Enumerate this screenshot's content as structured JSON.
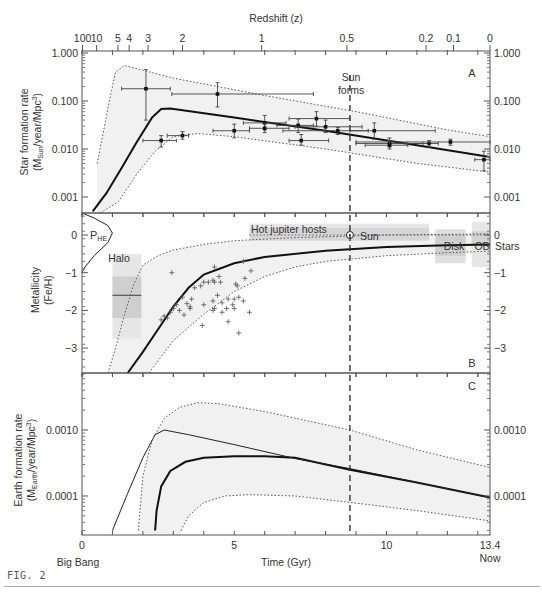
{
  "figure_label": "FIG. 2",
  "top_axis": {
    "title": "Redshift (z)",
    "ticks": [
      {
        "label": "100",
        "t": 0.02
      },
      {
        "label": "10",
        "t": 0.48
      },
      {
        "label": "5",
        "t": 1.18
      },
      {
        "label": "4",
        "t": 1.55
      },
      {
        "label": "3",
        "t": 2.17
      },
      {
        "label": "2",
        "t": 3.3
      },
      {
        "label": "1",
        "t": 5.9
      },
      {
        "label": "0.5",
        "t": 8.7
      },
      {
        "label": "0.2",
        "t": 11.3
      },
      {
        "label": "0.1",
        "t": 12.2
      },
      {
        "label": "0",
        "t": 13.4
      }
    ]
  },
  "bottom_axis": {
    "title": "Time (Gyr)",
    "ticks": [
      {
        "label": "0",
        "t": 0
      },
      {
        "label": "5",
        "t": 5
      },
      {
        "label": "10",
        "t": 10
      },
      {
        "label": "13.4",
        "t": 13.4
      }
    ],
    "start_label": "Big Bang",
    "end_label": "Now"
  },
  "sun_line": {
    "t": 8.8,
    "label_line1": "Sun",
    "label_line2": "forms"
  },
  "chart_data": [
    {
      "panel": "A",
      "type": "line",
      "title": "",
      "ylabel_line1": "Star formation rate",
      "ylabel_line2": "(M_Sun/year/Mpc^3)",
      "ylabel_main": "(M",
      "ylabel_sub": "Sun",
      "ylabel_rest": "/year/Mpc",
      "ylabel_sup": "3",
      "ylabel_close": ")",
      "xlabel": "Time (Gyr)",
      "yscale": "log",
      "ylim": [
        0.0005,
        1.0
      ],
      "yticks": [
        "1.000",
        "0.100",
        "0.010",
        "0.001"
      ],
      "ytick_values": [
        1.0,
        0.1,
        0.01,
        0.001
      ],
      "series": [
        {
          "name": "best-fit",
          "style": "solid-thick",
          "x": [
            0.35,
            0.8,
            1.3,
            1.8,
            2.3,
            2.6,
            2.9,
            5,
            8,
            11,
            13.4
          ],
          "y": [
            0.0005,
            0.0012,
            0.004,
            0.014,
            0.045,
            0.068,
            0.07,
            0.045,
            0.024,
            0.012,
            0.0068
          ]
        },
        {
          "name": "upper bound",
          "style": "dotted",
          "x": [
            0.5,
            0.9,
            1.1,
            1.4,
            3,
            6,
            9,
            12,
            13.4
          ],
          "y": [
            0.005,
            0.1,
            0.4,
            0.55,
            0.3,
            0.13,
            0.06,
            0.025,
            0.018
          ]
        },
        {
          "name": "lower bound",
          "style": "dotted",
          "x": [
            0.6,
            1.2,
            1.8,
            2.4,
            3.0,
            3.8,
            5,
            8,
            11,
            13.4
          ],
          "y": [
            0.0003,
            0.0008,
            0.003,
            0.009,
            0.018,
            0.021,
            0.018,
            0.01,
            0.005,
            0.0033
          ]
        }
      ],
      "points": [
        {
          "x": 2.1,
          "y": 0.18,
          "xerr": [
            1.3,
            2.9
          ],
          "yerr": [
            0.04,
            0.45
          ]
        },
        {
          "x": 4.45,
          "y": 0.14,
          "xerr": [
            2.95,
            7.6
          ],
          "yerr": [
            0.075,
            0.24
          ]
        },
        {
          "x": 2.6,
          "y": 0.015,
          "xerr": [
            2.0,
            3.1
          ],
          "yerr": [
            0.011,
            0.019
          ]
        },
        {
          "x": 3.3,
          "y": 0.019,
          "xerr": [
            2.8,
            3.5
          ],
          "yerr": [
            0.016,
            0.023
          ]
        },
        {
          "x": 5.0,
          "y": 0.024,
          "xerr": [
            4.3,
            5.5
          ],
          "yerr": [
            0.017,
            0.033
          ]
        },
        {
          "x": 6.0,
          "y": 0.035,
          "xerr": [
            5.3,
            6.7
          ],
          "yerr": [
            0.025,
            0.05
          ]
        },
        {
          "x": 6.0,
          "y": 0.027,
          "xerr": [
            5.5,
            6.8
          ],
          "yerr": [
            0.022,
            0.034
          ]
        },
        {
          "x": 7.1,
          "y": 0.031,
          "xerr": [
            6.4,
            7.6
          ],
          "yerr": [
            0.022,
            0.042
          ]
        },
        {
          "x": 7.7,
          "y": 0.043,
          "xerr": [
            6.8,
            8.8
          ],
          "yerr": [
            0.03,
            0.06
          ]
        },
        {
          "x": 8.0,
          "y": 0.029,
          "xerr": [
            7.0,
            9.2
          ],
          "yerr": [
            0.022,
            0.04
          ]
        },
        {
          "x": 7.2,
          "y": 0.015,
          "xerr": [
            6.8,
            8.1
          ],
          "yerr": [
            0.012,
            0.02
          ]
        },
        {
          "x": 8.4,
          "y": 0.024,
          "xerr": [
            6.6,
            9.4
          ],
          "yerr": [
            0.02,
            0.028
          ]
        },
        {
          "x": 9.6,
          "y": 0.024,
          "xerr": [
            8.8,
            11.6
          ],
          "yerr": [
            0.016,
            0.035
          ]
        },
        {
          "x": 10.1,
          "y": 0.013,
          "xerr": [
            9.0,
            11.2
          ],
          "yerr": [
            0.011,
            0.017
          ]
        },
        {
          "x": 10.1,
          "y": 0.012,
          "xerr": [
            9.3,
            10.7
          ],
          "yerr": [
            0.01,
            0.015
          ]
        },
        {
          "x": 11.4,
          "y": 0.013,
          "xerr": [
            10.7,
            11.7
          ],
          "yerr": [
            0.011,
            0.015
          ]
        },
        {
          "x": 12.1,
          "y": 0.014,
          "xerr": [
            9.0,
            13.4
          ],
          "yerr": [
            0.012,
            0.016
          ]
        },
        {
          "x": 13.2,
          "y": 0.006,
          "xerr": [
            12.9,
            13.4
          ],
          "yerr": [
            0.0035,
            0.009
          ]
        }
      ],
      "panel_label": "A"
    },
    {
      "panel": "B",
      "type": "line",
      "ylabel_line1": "Metallicity",
      "ylabel_line2": "(Fe/H)",
      "yscale": "linear",
      "ylim": [
        -3.7,
        0.6
      ],
      "yticks": [
        "0",
        "−1",
        "−2",
        "−3"
      ],
      "ytick_values": [
        0,
        -1,
        -2,
        -3
      ],
      "series": [
        {
          "name": "best-fit",
          "style": "solid-thick",
          "x": [
            1.5,
            2,
            2.5,
            3,
            3.5,
            4,
            5,
            6,
            8,
            10,
            12,
            13.4
          ],
          "y": [
            -3.7,
            -3.1,
            -2.5,
            -1.9,
            -1.4,
            -1.05,
            -0.75,
            -0.58,
            -0.42,
            -0.32,
            -0.27,
            -0.25
          ]
        },
        {
          "name": "upper bound",
          "style": "dotted",
          "x": [
            0.85,
            1.1,
            1.4,
            1.7,
            2.0,
            2.5,
            3,
            4,
            5,
            7,
            10,
            13.4
          ],
          "y": [
            -3.7,
            -3.0,
            -2.1,
            -1.3,
            -0.8,
            -0.55,
            -0.4,
            -0.25,
            -0.15,
            -0.07,
            0.0,
            0.03
          ]
        },
        {
          "name": "lower bound",
          "style": "dotted",
          "x": [
            2.2,
            3,
            4,
            5,
            6,
            7,
            8,
            10,
            12,
            13.4
          ],
          "y": [
            -3.7,
            -2.8,
            -2.1,
            -1.5,
            -1.1,
            -0.85,
            -0.7,
            -0.55,
            -0.47,
            -0.43
          ]
        },
        {
          "name": "P_HE",
          "style": "solid-thin",
          "x": [
            0.0,
            0.4,
            0.85,
            1.0,
            0.85,
            0.4,
            0.1,
            0.0
          ],
          "y": [
            0.6,
            0.45,
            0.25,
            0.05,
            -0.2,
            -0.55,
            -0.85,
            -1.0
          ]
        }
      ],
      "regions": [
        {
          "label": "Halo",
          "x0": 1.0,
          "x1": 1.95,
          "y0": -2.75,
          "y1": -0.5,
          "shade": "#e6e6e6"
        },
        {
          "label": "",
          "x0": 1.0,
          "x1": 1.95,
          "y0": -2.2,
          "y1": -1.1,
          "shade": "#cfcfcf"
        },
        {
          "label": "Hot jupiter hosts",
          "x0": 5.5,
          "x1": 11.4,
          "y0": -0.15,
          "y1": 0.2,
          "shade": "#d6d6d6"
        },
        {
          "label": "",
          "x0": 5.5,
          "x1": 11.4,
          "y0": 0.2,
          "y1": 0.3,
          "shade": "#e6e6e6"
        },
        {
          "label": "Disk",
          "x0": 11.6,
          "x1": 12.6,
          "y0": -0.75,
          "y1": 0.15,
          "shade": "#e0e0e0"
        },
        {
          "label": "",
          "x0": 11.6,
          "x1": 12.6,
          "y0": -0.55,
          "y1": 0.0,
          "shade": "#cfcfcf"
        },
        {
          "label": "OB",
          "x0": 12.8,
          "x1": 13.4,
          "y0": -0.85,
          "y1": 0.35,
          "shade": "#e6e6e6"
        },
        {
          "label": "",
          "x0": 12.8,
          "x1": 13.4,
          "y0": -0.3,
          "y1": 0.1,
          "shade": "#d2d2d2"
        }
      ],
      "halo_bar": {
        "x0": 1.0,
        "x1": 1.95,
        "y": -1.6
      },
      "sun_marker": {
        "x": 8.8,
        "y": 0.0,
        "label": "Sun"
      },
      "stars_label": "Stars",
      "phe_label": "P",
      "phe_sub": "HE",
      "scatter": [
        [
          2.6,
          -2.25
        ],
        [
          2.8,
          -2.2
        ],
        [
          2.9,
          -2.05
        ],
        [
          3.0,
          -1.95
        ],
        [
          2.7,
          -2.15
        ],
        [
          3.1,
          -1.85
        ],
        [
          3.2,
          -2.0
        ],
        [
          3.35,
          -2.12
        ],
        [
          3.3,
          -1.65
        ],
        [
          3.45,
          -1.82
        ],
        [
          3.55,
          -1.95
        ],
        [
          3.6,
          -1.7
        ],
        [
          3.7,
          -1.4
        ],
        [
          3.9,
          -1.35
        ],
        [
          4.0,
          -1.25
        ],
        [
          4.15,
          -1.25
        ],
        [
          4.3,
          -1.2
        ],
        [
          4.35,
          -1.25
        ],
        [
          4.5,
          -1.1
        ],
        [
          4.55,
          -1.25
        ],
        [
          3.55,
          -1.9
        ],
        [
          4.0,
          -1.85
        ],
        [
          4.3,
          -1.75
        ],
        [
          4.45,
          -1.6
        ],
        [
          4.6,
          -1.8
        ],
        [
          4.8,
          -1.7
        ],
        [
          4.75,
          -1.95
        ],
        [
          4.95,
          -1.85
        ],
        [
          5.0,
          -1.7
        ],
        [
          5.05,
          -1.3
        ],
        [
          5.1,
          -1.35
        ],
        [
          5.15,
          -1.65
        ],
        [
          5.3,
          -1.75
        ],
        [
          5.35,
          -1.15
        ],
        [
          5.0,
          -1.95
        ],
        [
          4.3,
          -2.0
        ],
        [
          4.35,
          -1.95
        ],
        [
          4.6,
          -2.05
        ],
        [
          4.8,
          -2.3
        ],
        [
          3.95,
          -2.4
        ],
        [
          5.15,
          -2.6
        ],
        [
          5.5,
          -2.05
        ],
        [
          5.55,
          -0.95
        ],
        [
          2.95,
          -1.0
        ],
        [
          4.35,
          -0.85
        ],
        [
          5.3,
          -0.7
        ]
      ],
      "panel_label": "B"
    },
    {
      "panel": "C",
      "type": "line",
      "ylabel_line1": "Earth formation rate",
      "ylabel_main": "(M",
      "ylabel_sub": "Earth",
      "ylabel_rest": "/year/Mpc",
      "ylabel_sup": "3",
      "ylabel_close": ")",
      "yscale": "log",
      "ylim": [
        3e-05,
        0.006
      ],
      "yticks": [
        "0.0010",
        "0.0001"
      ],
      "ytick_values": [
        0.001,
        0.0001
      ],
      "series": [
        {
          "name": "earth-rate best-fit",
          "style": "solid-thick",
          "x": [
            2.4,
            2.45,
            2.6,
            2.9,
            3.4,
            4,
            5,
            6,
            7,
            8.8,
            11,
            13.4
          ],
          "y": [
            3e-05,
            6e-05,
            0.00014,
            0.00024,
            0.00033,
            0.00038,
            0.0004,
            0.0004,
            0.00038,
            0.00025,
            0.00016,
            9.5e-05
          ]
        },
        {
          "name": "scaled star-formation rate",
          "style": "solid-thin",
          "x": [
            1.0,
            1.5,
            2.0,
            2.4,
            2.7,
            3.5,
            5,
            7,
            8.8,
            11,
            13.4
          ],
          "y": [
            3e-05,
            0.00011,
            0.00038,
            0.00085,
            0.001,
            0.00085,
            0.0006,
            0.00037,
            0.00026,
            0.00016,
            9.5e-05
          ]
        },
        {
          "name": "upper bound",
          "style": "dotted",
          "x": [
            1.85,
            2.0,
            2.3,
            2.7,
            3.2,
            3.8,
            4.5,
            6,
            8.8,
            11,
            13.4
          ],
          "y": [
            3e-05,
            0.0002,
            0.0007,
            0.0015,
            0.0022,
            0.0026,
            0.0025,
            0.0019,
            0.001,
            0.0005,
            0.00027
          ]
        },
        {
          "name": "lower bound",
          "style": "dotted",
          "x": [
            3.25,
            3.5,
            4,
            4.7,
            5.5,
            7,
            8.8,
            11,
            13.4
          ],
          "y": [
            3e-05,
            5e-05,
            8e-05,
            0.0001,
            0.000105,
            0.0001,
            8e-05,
            6e-05,
            4.2e-05
          ]
        }
      ],
      "panel_label": "C"
    }
  ]
}
